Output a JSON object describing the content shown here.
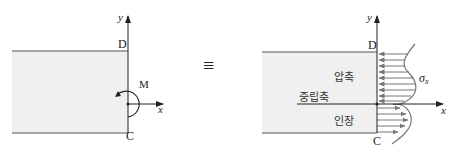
{
  "left_figure": {
    "axis_y_label": "y",
    "axis_x_label": "x",
    "top_point_label": "D",
    "bottom_point_label": "C",
    "moment_label": "M"
  },
  "equivalence_symbol": "≡",
  "right_figure": {
    "axis_y_label": "y",
    "axis_x_label": "x",
    "top_point_label": "D",
    "bottom_point_label": "C",
    "compression_label": "압축",
    "neutral_axis_label": "중립축",
    "tension_label": "인장",
    "stress_label": "σ",
    "stress_subscript": "x"
  },
  "colors": {
    "beam_fill": "#f0f0f0",
    "beam_edge": "#555555",
    "axis": "#222222",
    "stress_arrows": "#777777"
  }
}
